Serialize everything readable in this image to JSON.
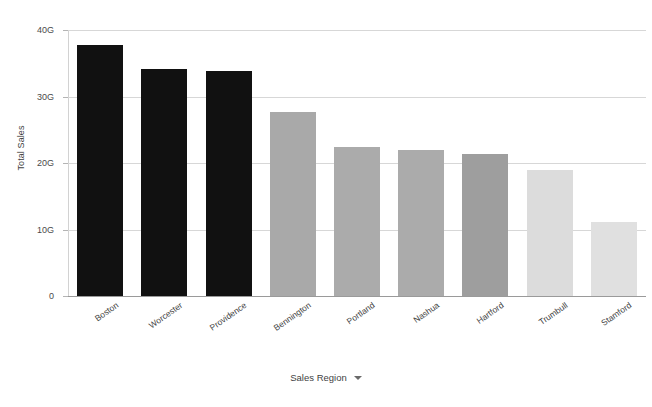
{
  "chart_data": {
    "type": "bar",
    "title": "",
    "xlabel": "Sales Region",
    "ylabel": "Total Sales",
    "ylim": [
      0,
      40000000000
    ],
    "ytick_labels": [
      "0",
      "10G",
      "20G",
      "30G",
      "40G"
    ],
    "ytick_values": [
      0,
      10000000000,
      20000000000,
      30000000000,
      40000000000
    ],
    "grid": true,
    "legend": false,
    "categories": [
      "Boston",
      "Worcester",
      "Providence",
      "Bennington",
      "Portland",
      "Nashua",
      "Hartford",
      "Trumbull",
      "Stamford"
    ],
    "values": [
      37.7,
      34.2,
      33.8,
      27.7,
      22.4,
      22.0,
      21.3,
      18.9,
      11.2
    ],
    "value_unit": "G",
    "bar_colors": [
      "#111111",
      "#111111",
      "#111111",
      "#a9a9a9",
      "#ababab",
      "#ababab",
      "#9e9e9e",
      "#dcdcdc",
      "#e0e0e0"
    ]
  },
  "axes": {
    "y_title": "Total Sales",
    "x_title": "Sales Region",
    "x_title_caret": "chevron-down"
  },
  "colors": {
    "background": "#ffffff",
    "gridline": "#d7d7d7",
    "baseline": "#9a9a9a",
    "axis_text": "#3f3f3f"
  }
}
